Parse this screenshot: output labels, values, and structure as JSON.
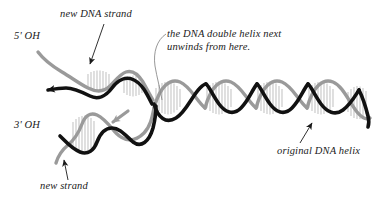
{
  "figure": {
    "width": 391,
    "height": 203,
    "background_color": "#ffffff"
  },
  "colors": {
    "new_strand": "#111111",
    "template_strand": "#9a9a9a",
    "base_pairs": "#b5b5b5",
    "text": "#1a1a1a",
    "leader_line": "#8c8c8c"
  },
  "labels": {
    "new_dna_strand": "new DNA strand",
    "five_prime_oh": "5' OH",
    "three_prime_oh": "3' OH",
    "unwind_note": "the DNA double helix next unwinds from here.",
    "new_strand": "new strand",
    "original_dna_helix": "original DNA helix"
  },
  "icons": {
    "pointer_new_dna_strand": "arrow-down-left-icon",
    "pointer_new_strand": "arrow-up-icon",
    "pointer_original_helix": "arrow-up-right-icon",
    "leader_unwind": "curved-leader-line-icon",
    "arrowhead_upper_new_strand": "strand-direction-arrowhead-icon",
    "arrowhead_lower_template_strand": "strand-direction-arrowhead-icon"
  },
  "elements": {
    "original_helix": {
      "name": "original DNA helix",
      "description": "intact double helix at right formed by black new-synthesized strand wound with gray template strand, base pairs drawn as vertical hatch lines",
      "turns": 4,
      "x_start": 150,
      "x_end": 372
    },
    "upper_fork_arm": {
      "name": "upper separated strand pair",
      "five_prime_end": "5' OH",
      "new_strand_color": "#111111",
      "template_strand_color": "#9a9a9a"
    },
    "lower_fork_arm": {
      "name": "lower separated strand pair",
      "three_prime_end": "3' OH",
      "new_strand_color": "#111111",
      "template_strand_color": "#9a9a9a"
    }
  }
}
